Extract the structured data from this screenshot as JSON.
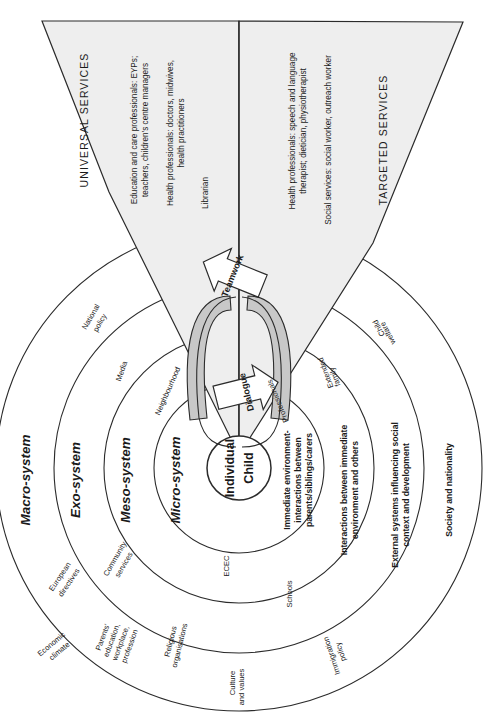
{
  "diagram": {
    "orientation": "rotated-90-clockwise",
    "colors": {
      "wedge_fill": "#eeeeee",
      "band_fill": "#c8c8c8",
      "stroke": "#2b2b2b",
      "text": "#1a1a1a",
      "page_bg": "#ffffff"
    },
    "center": {
      "line1": "Individual",
      "line2": "Child"
    },
    "rings": [
      {
        "id": "micro",
        "system_label": "Micro-system",
        "description_lines": [
          "Immediate environment-",
          "interactions between",
          "parents/siblings/carers"
        ],
        "item_labels": [
          "Neighbourhood",
          "ECEC",
          "Professionals"
        ]
      },
      {
        "id": "meso",
        "system_label": "Meso-system",
        "description_lines": [
          "Interactions between immediate",
          "environment and others"
        ],
        "item_labels": [
          "Community services",
          "Schools",
          "Extended family"
        ]
      },
      {
        "id": "exo",
        "system_label": "Exo-system",
        "description_lines": [
          "External systems influencing social",
          "context and development"
        ],
        "item_labels": [
          "Media",
          "Parents' education, workplace, profession",
          "Religious organisations",
          "Child welfare"
        ]
      },
      {
        "id": "macro",
        "system_label": "Macro-system",
        "description_lines": [
          "Society and nationality"
        ],
        "item_labels": [
          "National policy",
          "European directives",
          "Economic climate",
          "Culture and values",
          "Immigration policy"
        ]
      }
    ],
    "ring_items": {
      "national_policy": "National policy",
      "media": "Media",
      "neighbourhood": "Neighbourhood",
      "european_directives": "European directives",
      "community_services": "Community services",
      "ecec": "ECEC",
      "economic_climate": "Economic climate",
      "parents_education": "Parents' education, workplace, profession",
      "religious_organisations": "Religious organisations",
      "schools": "Schools",
      "culture_and_values": "Culture and values",
      "immigration_policy": "Immigration policy",
      "professionals": "Professionals",
      "extended_family": "Extended family",
      "child_welfare": "Child welfare"
    },
    "system_descriptions": {
      "micro_l1": "Immediate environment-",
      "micro_l2": "interactions between",
      "micro_l3": "parents/siblings/carers",
      "meso_l1": "Interactions between immediate",
      "meso_l2": "environment and others",
      "exo_l1": "External systems influencing social",
      "exo_l2": "context and development",
      "macro_l1": "Society and nationality"
    },
    "system_labels": {
      "micro": "Micro-system",
      "meso": "Meso-system",
      "exo": "Exo-system",
      "macro": "Macro-system"
    },
    "wedges": {
      "universal": {
        "title": "UNIVERSAL SERVICES",
        "entries": [
          {
            "lines": [
              "Education and care professionals: EYPs;",
              "teachers, children's centre managers"
            ]
          },
          {
            "lines": [
              "Health professionals: doctors, midwives,",
              "health practitioners"
            ]
          },
          {
            "lines": [
              "Librarian"
            ]
          }
        ]
      },
      "targeted": {
        "title": "TARGETED SERVICES",
        "entries": [
          {
            "lines": [
              "Health professionals: speech and language",
              "therapist; dietician, physiotherapist"
            ]
          },
          {
            "lines": [
              "Social services: social worker, outreach worker"
            ]
          }
        ]
      }
    },
    "arrows": [
      {
        "id": "teamwork",
        "label": "Teamwork",
        "direction": "down-into-child"
      },
      {
        "id": "dialogue",
        "label": "Dialogue",
        "direction": "up-out-of-child"
      }
    ]
  }
}
